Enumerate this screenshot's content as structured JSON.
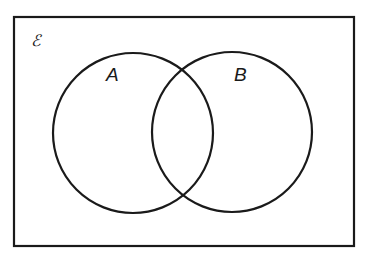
{
  "diagram": {
    "type": "venn",
    "universal_set_label": "ℰ",
    "sets": [
      {
        "label": "A",
        "cx": 133,
        "cy": 133,
        "r": 80
      },
      {
        "label": "B",
        "cx": 232,
        "cy": 132,
        "r": 80
      }
    ],
    "frame": {
      "x": 14,
      "y": 17,
      "width": 340,
      "height": 229
    },
    "stroke_color": "#1a1a1a",
    "background": "#ffffff"
  }
}
